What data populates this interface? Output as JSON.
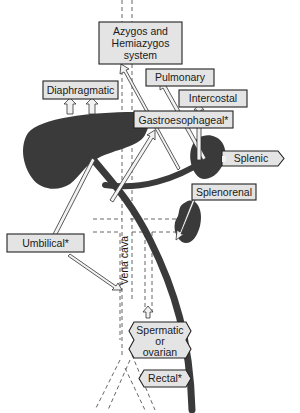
{
  "diagram": {
    "labels": {
      "azygos_line1": "Azygos and",
      "azygos_line2": "Hemiazygos",
      "azygos_line3": "system",
      "diaphragmatic": "Diaphragmatic",
      "pulmonary": "Pulmonary",
      "intercostal": "Intercostal",
      "gastroesophageal": "Gastroesophageal*",
      "splenic": "Splenic",
      "splenorenal": "Splenorenal",
      "umbilical": "Umbilical*",
      "vena_cava": "Vena cava",
      "spermatic_line1": "Spermatic",
      "spermatic_line2": "or",
      "spermatic_line3": "ovarian",
      "rectal": "Rectal*"
    },
    "structures": [
      "liver",
      "spleen",
      "kidney",
      "portal vein",
      "vena cava",
      "azygos vessel"
    ],
    "colors": {
      "organ": "#3a3a3a",
      "box_fill": "#e4e4e4",
      "box_stroke": "#222222",
      "arrow_fill": "#f2f2f2"
    }
  }
}
